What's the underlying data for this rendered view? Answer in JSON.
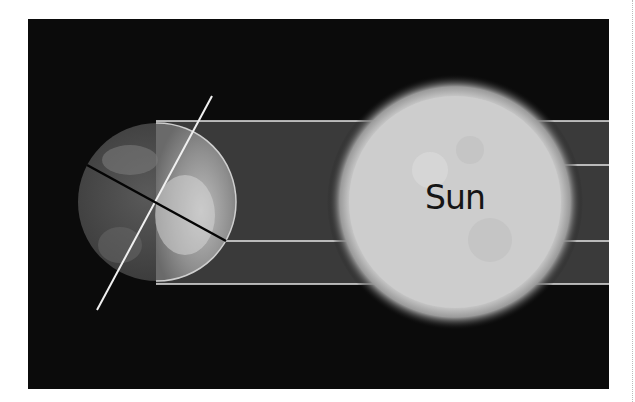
{
  "diagram": {
    "labels": {
      "sun": "Sun"
    },
    "colors": {
      "background": "#0b0b0b",
      "sunlight_band": "#3a3a3a",
      "sun_surface": "#cfcfcf",
      "lines": "#e6e6e6",
      "axis_line": "#f0f0f0",
      "equator_line": "#050505"
    }
  }
}
